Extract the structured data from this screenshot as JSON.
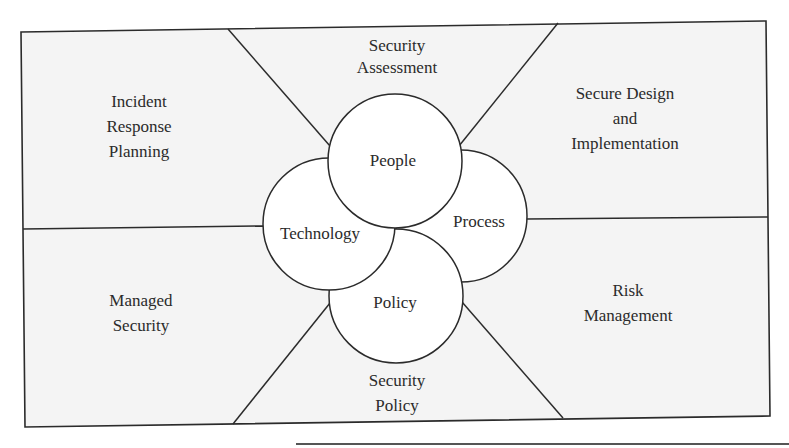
{
  "diagram": {
    "colors": {
      "background": "#ffffff",
      "panel_fill": "#f3f3f3",
      "stroke": "#2b2b2b",
      "circle_fill": "#ffffff",
      "text": "#2b2b2b"
    },
    "core": {
      "people": "People",
      "process": "Process",
      "technology": "Technology",
      "policy": "Policy"
    },
    "regions": {
      "security_assessment": [
        "Security",
        "Assessment"
      ],
      "incident_response_planning": [
        "Incident",
        "Response",
        "Planning"
      ],
      "secure_design_implementation": [
        "Secure Design",
        "and",
        "Implementation"
      ],
      "managed_security": [
        "Managed",
        "Security"
      ],
      "risk_management": [
        "Risk",
        "Management"
      ],
      "security_policy": [
        "Security",
        "Policy"
      ]
    }
  }
}
